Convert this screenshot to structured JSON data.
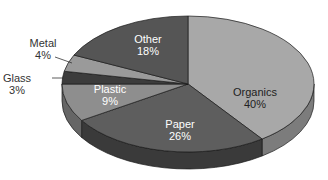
{
  "chart_data": {
    "type": "pie",
    "style": "3d-exploded-none",
    "title": "",
    "start_angle_deg": -90,
    "direction": "clockwise",
    "geometry": {
      "cx": 188,
      "cy": 84,
      "rx": 126,
      "ry": 68,
      "depth": 17
    },
    "slices": [
      {
        "name": "Organics",
        "value": 40,
        "label": "Organics",
        "pct": "40%",
        "color": "#a8a8a8",
        "side": "#7c7c7c",
        "label_pos": [
          255,
          98
        ],
        "label_class": "in-dark"
      },
      {
        "name": "Paper",
        "value": 26,
        "label": "Paper",
        "pct": "26%",
        "color": "#5e5e5e",
        "side": "#3a3a3a",
        "label_pos": [
          180,
          130
        ],
        "label_class": "in-light"
      },
      {
        "name": "Plastic",
        "value": 9,
        "label": "Plastic",
        "pct": "9%",
        "color": "#8e8e8e",
        "side": "#666666",
        "label_pos": [
          110,
          95
        ],
        "label_class": "in-light"
      },
      {
        "name": "Glass",
        "value": 3,
        "label": "Glass",
        "pct": "3%",
        "color": "#3c3c3c",
        "side": "#2a2a2a",
        "label_pos": [
          17,
          84
        ],
        "label_class": "out"
      },
      {
        "name": "Metal",
        "value": 4,
        "label": "Metal",
        "pct": "4%",
        "color": "#9a9a9a",
        "side": "#707070",
        "label_pos": [
          43,
          49
        ],
        "label_class": "out"
      },
      {
        "name": "Other",
        "value": 18,
        "label": "Other",
        "pct": "18%",
        "color": "#555555",
        "side": "#3a3a3a",
        "label_pos": [
          148,
          45
        ],
        "label_class": "in-light"
      }
    ],
    "leader_lines": [
      {
        "for": "Metal",
        "x1": 55,
        "y1": 57,
        "x2": 72,
        "y2": 63
      },
      {
        "for": "Glass",
        "x1": 52,
        "y1": 78,
        "x2": 64,
        "y2": 78
      }
    ],
    "legend": "none"
  }
}
